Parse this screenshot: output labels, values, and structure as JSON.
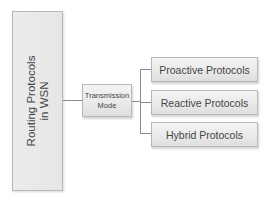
{
  "diagram": {
    "root": {
      "label_line1": "Routing Protocols",
      "label_line2": "in WSN"
    },
    "intermediate": {
      "label_line1": "Transmission",
      "label_line2": "Mode"
    },
    "leaves": [
      {
        "label": "Proactive Protocols"
      },
      {
        "label": "Reactive Protocols"
      },
      {
        "label": "Hybrid Protocols"
      }
    ],
    "colors": {
      "box_fill_top": "#f3f3f3",
      "box_fill_bottom": "#dedede",
      "box_border": "#b8b8b8",
      "connector": "#8a8a8a",
      "text": "#454545"
    }
  }
}
